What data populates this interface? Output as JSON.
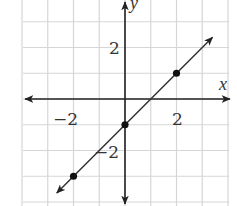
{
  "chart_data": {
    "type": "line",
    "title": "",
    "xlabel": "x",
    "ylabel": "y",
    "xlim": [
      -4,
      4
    ],
    "ylim": [
      -4,
      4
    ],
    "grid": true,
    "x_ticks_labeled": [
      -2,
      2
    ],
    "y_ticks_labeled": [
      2,
      -2
    ],
    "tick_labels": {
      "x_neg": "−2",
      "x_pos": "2",
      "y_pos": "2",
      "y_neg": "−2"
    },
    "series": [
      {
        "name": "y = x - 1",
        "equation": "y = x - 1",
        "slope": 1,
        "intercept": -1,
        "arrows_both_ends": true,
        "points": [
          {
            "x": -2,
            "y": -3
          },
          {
            "x": 0,
            "y": -1
          },
          {
            "x": 2,
            "y": 1
          }
        ]
      }
    ],
    "colors": {
      "grid": "#d6d6d6",
      "axes": "#222222",
      "line": "#333333",
      "points": "#111111"
    }
  }
}
